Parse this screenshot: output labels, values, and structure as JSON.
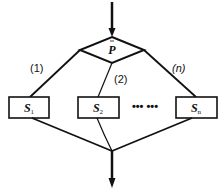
{
  "diagram": {
    "type": "flowchart-multi-branch-selection",
    "condition": {
      "label": "P"
    },
    "branches": [
      {
        "label": "(1)",
        "block": {
          "symbol": "S",
          "subscript": "1"
        }
      },
      {
        "label": "(2)",
        "block": {
          "symbol": "S",
          "subscript": "2"
        }
      },
      {
        "label": "(n)",
        "block": {
          "symbol": "S",
          "subscript": "n"
        }
      }
    ],
    "ellipsis": "•••  •••",
    "colors": {
      "stroke": "#111111",
      "background": "#ffffff"
    }
  }
}
